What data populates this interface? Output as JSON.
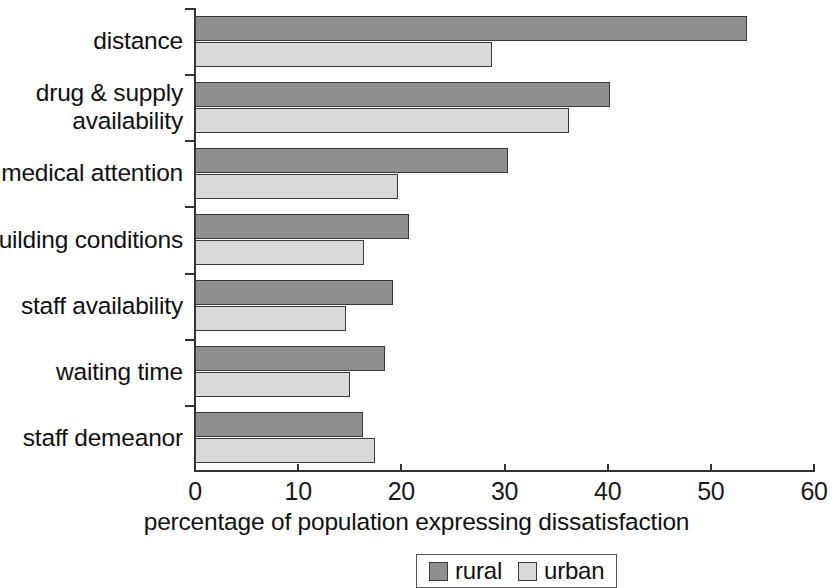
{
  "chart_data": {
    "type": "bar",
    "orientation": "horizontal",
    "title": "",
    "xlabel": "percentage of population expressing dissatisfaction",
    "ylabel": "",
    "xlim": [
      0,
      60
    ],
    "xticks": [
      0,
      10,
      20,
      30,
      40,
      50,
      60
    ],
    "xtick_labels": [
      "0",
      "10",
      "20",
      "30",
      "40",
      "50",
      "60"
    ],
    "grid": false,
    "legend_position": "bottom-center",
    "categories": [
      "distance",
      "drug & supply\navailability",
      "medical attention",
      "building conditions",
      "staff availability",
      "waiting time",
      "staff demeanor"
    ],
    "series": [
      {
        "name": "rural",
        "color": "#8f8f8f",
        "values": [
          53.5,
          40.2,
          30.3,
          20.7,
          19.2,
          18.4,
          16.3
        ]
      },
      {
        "name": "urban",
        "color": "#d9d9d9",
        "values": [
          28.8,
          36.3,
          19.7,
          16.4,
          14.6,
          15.0,
          17.4
        ]
      }
    ]
  },
  "legend": {
    "items": [
      {
        "label": "rural",
        "swatch": "rural"
      },
      {
        "label": "urban",
        "swatch": "urban"
      }
    ]
  }
}
